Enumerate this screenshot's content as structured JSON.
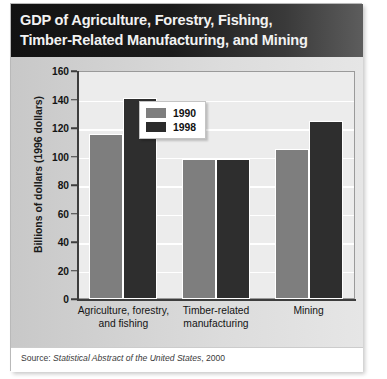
{
  "figure": {
    "title_lines": [
      "GDP of Agriculture, Forestry, Fishing,",
      "Timber-Related Manufacturing, and Mining"
    ],
    "source_prefix": "Source:",
    "source_title": "Statistical Abstract of the United States",
    "source_year": ", 2000"
  },
  "chart_data": {
    "type": "bar",
    "title": "GDP of Agriculture, Forestry, Fishing, Timber-Related Manufacturing, and Mining",
    "xlabel": "",
    "ylabel": "Billions of dollars (1996 dollars)",
    "ylim": [
      0,
      160
    ],
    "ytick_labels": [
      "160",
      "140",
      "120",
      "100",
      "80",
      "60",
      "40",
      "20",
      "0"
    ],
    "yticks": [
      160,
      140,
      120,
      100,
      80,
      60,
      40,
      20,
      0
    ],
    "grid": true,
    "grid_axis": "y",
    "legend_position": "upper-center",
    "categories": [
      "Agriculture, forestry,\nand fishing",
      "Timber-related\nmanufacturing",
      "Mining"
    ],
    "category_lines": [
      [
        "Agriculture, forestry,",
        "and fishing"
      ],
      [
        "Timber-related",
        "manufacturing"
      ],
      [
        "Mining"
      ]
    ],
    "series": [
      {
        "name": "1990",
        "color": "#7e7e7e",
        "values": [
          116,
          98,
          105
        ]
      },
      {
        "name": "1998",
        "color": "#2e2e2e",
        "values": [
          141,
          98,
          125
        ]
      }
    ]
  }
}
